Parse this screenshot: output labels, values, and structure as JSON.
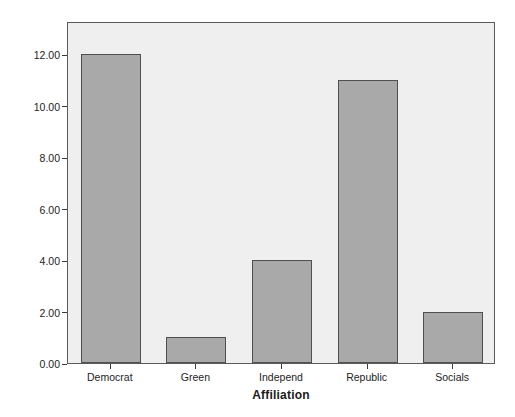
{
  "chart_data": {
    "type": "bar",
    "title": "",
    "subtitle": "",
    "categories": [
      "Democrat",
      "Green",
      "Independ",
      "Republic",
      "Socials"
    ],
    "values": [
      12,
      1,
      4,
      11,
      2
    ],
    "xlabel": "Affiliation",
    "ylabel": "Frequency",
    "ylim": [
      0,
      13.3
    ],
    "y_ticks": [
      0,
      2,
      4,
      6,
      8,
      10,
      12
    ],
    "y_tick_labels": [
      "0.00",
      "2.00",
      "4.00",
      "6.00",
      "8.00",
      "10.00",
      "12.00"
    ],
    "grid": false,
    "legend": null,
    "legend_position": "none",
    "annotations": [],
    "colors": {
      "bar_fill": "#a9a9a9",
      "bar_border": "#4f4f4f",
      "plot_background": "#efefef",
      "frame_border": "#5a5a5a",
      "page_background": "#ffffff",
      "text": "#1d1d1d"
    }
  }
}
